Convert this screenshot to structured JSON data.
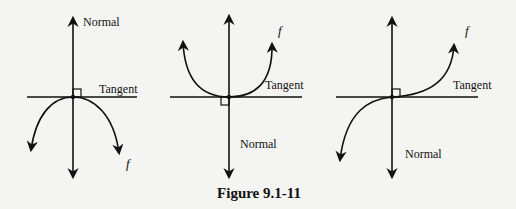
{
  "figure": {
    "caption": "Figure 9.1-11",
    "panels": [
      {
        "id": "concave-down",
        "normal_label": "Normal",
        "tangent_label": "Tangent",
        "function_label": "f"
      },
      {
        "id": "concave-up",
        "normal_label": "Normal",
        "tangent_label": "Tangent",
        "function_label": "f"
      },
      {
        "id": "inflection",
        "normal_label": "Normal",
        "tangent_label": "Tangent",
        "function_label": "f"
      }
    ]
  },
  "colors": {
    "background": "#f4f4f2",
    "ink": "#111111"
  }
}
